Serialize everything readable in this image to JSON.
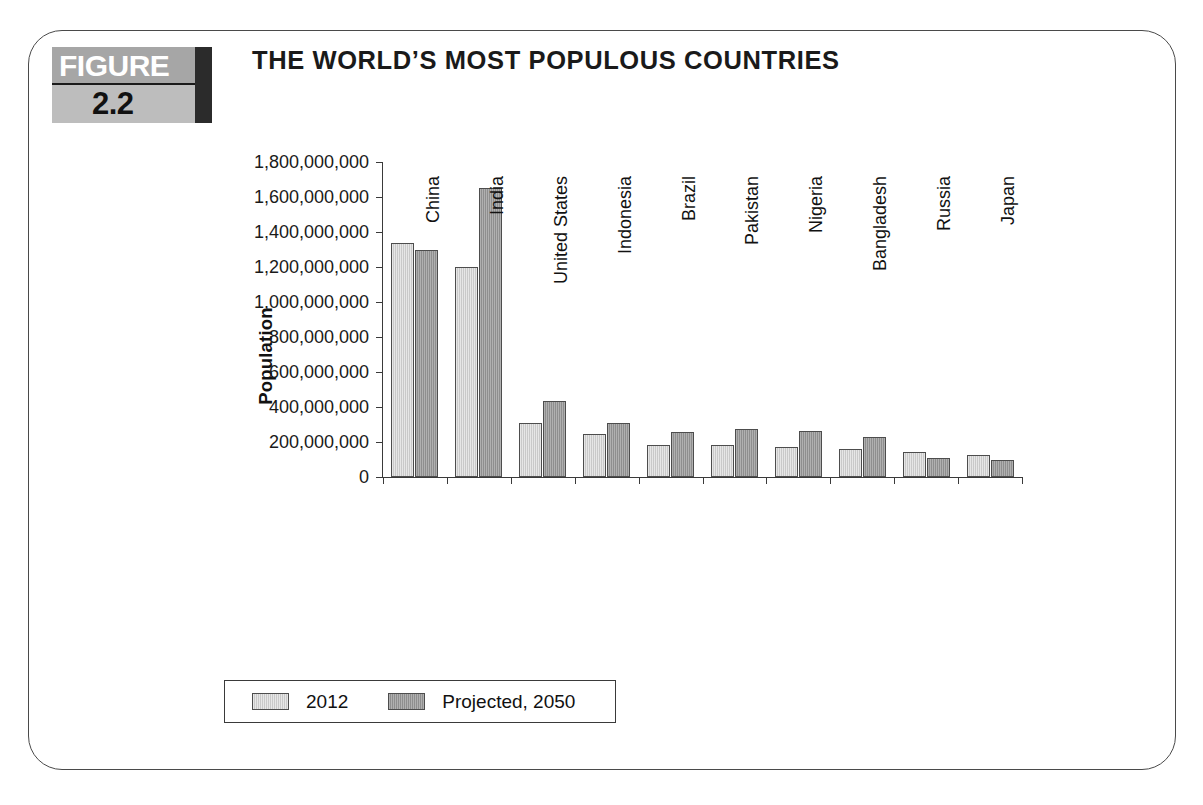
{
  "figure": {
    "badge_word": "FIGURE",
    "badge_number": "2.2",
    "title": "THE WORLD’S MOST POPULOUS COUNTRIES"
  },
  "colors": {
    "series_2012": "#c9c9c9",
    "series_2050": "#8e8e8e",
    "axis": "#3a3a3a",
    "bar_outline": "#4d4d4d",
    "frame": "#4a4a4a",
    "badge_top": "#a6a6a6",
    "badge_bottom": "#bdbdbd",
    "badge_bar": "#2b2b2b"
  },
  "chart_data": {
    "type": "bar",
    "title": "THE WORLD’S MOST POPULOUS COUNTRIES",
    "xlabel": "",
    "ylabel": "Population",
    "ylim": [
      0,
      1800000000
    ],
    "ytick_step": 200000000,
    "grid": false,
    "legend_position": "bottom",
    "categories": [
      "China",
      "India",
      "United States",
      "Indonesia",
      "Brazil",
      "Pakistan",
      "Nigeria",
      "Bangladesh",
      "Russia",
      "Japan"
    ],
    "ytick_labels": [
      "0",
      "200,000,000",
      "400,000,000",
      "600,000,000",
      "800,000,000",
      "1,000,000,000",
      "1,200,000,000",
      "1,400,000,000",
      "1,600,000,000",
      "1,800,000,000"
    ],
    "ytick_values": [
      0,
      200000000,
      400000000,
      600000000,
      800000000,
      1000000000,
      1200000000,
      1400000000,
      1600000000,
      1800000000
    ],
    "series": [
      {
        "name": "2012",
        "color": "#c9c9c9",
        "values": [
          1340000000,
          1200000000,
          310000000,
          245000000,
          185000000,
          185000000,
          170000000,
          160000000,
          143000000,
          128000000
        ]
      },
      {
        "name": "Projected, 2050",
        "color": "#8e8e8e",
        "values": [
          1300000000,
          1650000000,
          435000000,
          310000000,
          255000000,
          275000000,
          265000000,
          230000000,
          110000000,
          95000000
        ]
      }
    ]
  },
  "legend": {
    "entries": [
      {
        "label": "2012"
      },
      {
        "label": "Projected, 2050"
      }
    ]
  }
}
